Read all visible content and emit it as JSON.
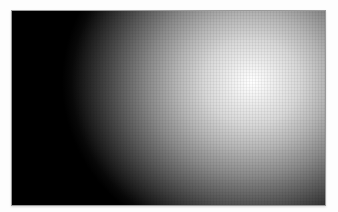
{
  "image": {
    "description": "Radial gradient from black (left) to white highlight (upper right) inside a bordered rectangle",
    "colors": {
      "background": "#ffffff",
      "border": "#9a9a9a",
      "dark": "#000000",
      "highlight": "#ffffff"
    },
    "highlight_center": [
      250,
      80
    ]
  }
}
